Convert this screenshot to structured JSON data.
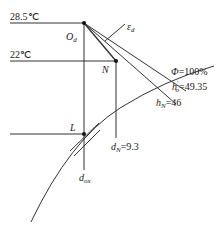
{
  "diagram": {
    "type": "psychrometric-process-diagram",
    "temperatures": {
      "t_upper": "28.5℃",
      "t_lower": "22℃"
    },
    "points": {
      "O_d": {
        "label": "O",
        "sub": "d"
      },
      "N": {
        "label": "N"
      },
      "L": {
        "label": "L"
      }
    },
    "process_line": {
      "label": "ε",
      "sub": "d"
    },
    "curves": {
      "saturation": "Φ=100%",
      "h_o_prime": {
        "label": "h",
        "prime": "′",
        "sub": "o",
        "value": "=49.35"
      },
      "h_N": {
        "label": "h",
        "sub": "N",
        "value": "=46"
      }
    },
    "moisture": {
      "d_N": {
        "label": "d",
        "sub": "N",
        "value": "=9.3"
      },
      "d_ox": {
        "label": "d",
        "sub": "ox"
      }
    }
  }
}
